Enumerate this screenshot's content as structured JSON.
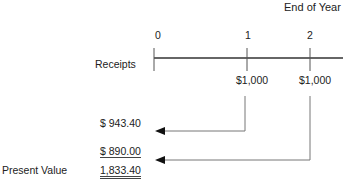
{
  "diagram": {
    "header": "End of Year",
    "row_label": "Receipts",
    "periods": [
      "0",
      "1",
      "2"
    ],
    "receipts": [
      "$1,000",
      "$1,000"
    ],
    "pv_items": [
      "$ 943.40",
      "$ 890.00"
    ],
    "total_label": "Present Value",
    "total_value": "1,833.40"
  }
}
